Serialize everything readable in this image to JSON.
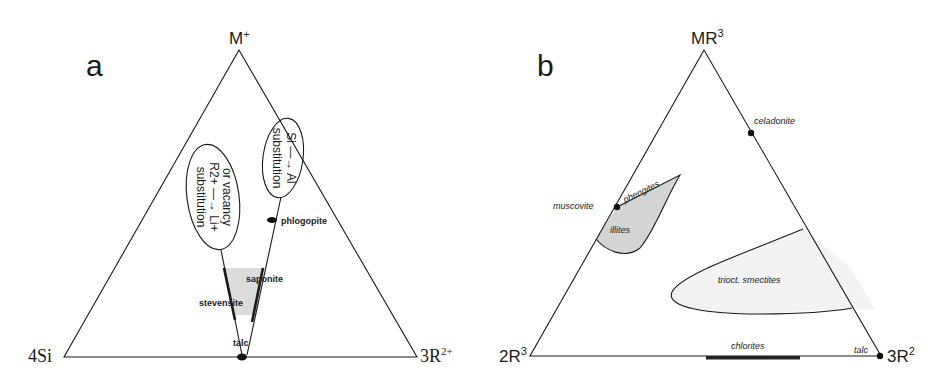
{
  "figure": {
    "panels": [
      {
        "id": "a",
        "letter": "a",
        "vertices": {
          "top": {
            "base": "M",
            "sup": "+"
          },
          "left": {
            "base": "4Si",
            "sup": ""
          },
          "right": {
            "base": "3R",
            "sup": "2+"
          }
        },
        "ellipses": [
          {
            "name": "substitution-r2-li",
            "lines": [
              "substitution",
              "R2+ → Li+",
              "or vacancy"
            ],
            "line1": "substitution",
            "line2": "R2+ —→ Li+",
            "line3": "or vacancy"
          },
          {
            "name": "substitution-si-al",
            "line1": "substitution",
            "line2": "Si —→ Al"
          }
        ],
        "labels": {
          "phlogopite": "phlogopite",
          "saponite": "saponite",
          "stevensite": "stevensite",
          "talc": "talc"
        }
      },
      {
        "id": "b",
        "letter": "b",
        "vertices": {
          "top": {
            "base": "MR",
            "sup": "3"
          },
          "left": {
            "base": "2R",
            "sup": "3"
          },
          "right": {
            "base": "3R",
            "sup": "2"
          }
        },
        "labels": {
          "celadonite": "celadonite",
          "muscovite": "muscovite",
          "phengites": "phengites",
          "illites": "illites",
          "trioct_smectites": "trioct. smectites",
          "chlorites": "chlorites",
          "talc": "talc"
        }
      }
    ],
    "colors": {
      "line": "#1a1a1a",
      "illites_fill": "#d4d4d4",
      "smectite_fill": "#f3f3f3",
      "gray_region_a": "#dcdcdc"
    }
  }
}
